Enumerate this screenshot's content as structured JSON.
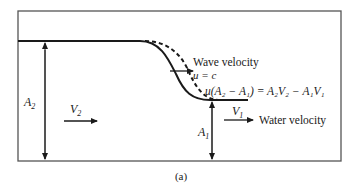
{
  "figure": {
    "caption": "(a)",
    "labels": {
      "wave_velocity": "Wave velocity",
      "u_eq_c": "u = c",
      "continuity_equation": "u(A₂ − A₁) = A₂V₂ − A₁V₁",
      "water_velocity": "Water velocity",
      "A2": "A",
      "A2_sub": "2",
      "A1": "A",
      "A1_sub": "1",
      "V2": "V",
      "V2_sub": "2",
      "V1": "V",
      "V1_sub": "1"
    },
    "colors": {
      "line": "#1a1a1a",
      "frame": "#555555",
      "background": "#ffffff"
    }
  }
}
